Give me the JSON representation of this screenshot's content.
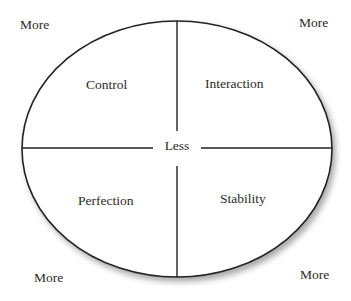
{
  "diagram": {
    "type": "quadrant-ellipse",
    "center_label": "Less",
    "corner_labels": {
      "top_left": "More",
      "top_right": "More",
      "bottom_left": "More",
      "bottom_right": "More"
    },
    "quadrants": {
      "top_left": "Control",
      "top_right": "Interaction",
      "bottom_left": "Perfection",
      "bottom_right": "Stability"
    },
    "colors": {
      "stroke": "#222222",
      "text": "#2b2b2b",
      "background": "#ffffff",
      "shadow": "#bdbdbd"
    }
  }
}
